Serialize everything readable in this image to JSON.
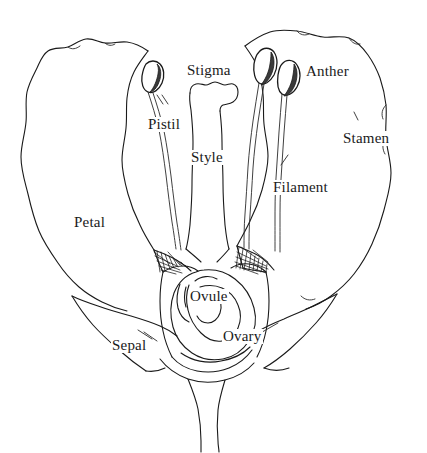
{
  "diagram": {
    "style": "hand-drawn line illustration",
    "ink_color": "#1a1a1a",
    "background_color": "#ffffff",
    "labels": [
      {
        "id": "stigma",
        "text": "Stigma",
        "x": 186,
        "y": 63,
        "part": "stigma"
      },
      {
        "id": "anther",
        "text": "Anther",
        "x": 305,
        "y": 64,
        "part": "anther"
      },
      {
        "id": "pistil",
        "text": "Pistil",
        "x": 147,
        "y": 117,
        "part": "pistil"
      },
      {
        "id": "stamen",
        "text": "Stamen",
        "x": 342,
        "y": 131,
        "part": "stamen"
      },
      {
        "id": "style",
        "text": "Style",
        "x": 190,
        "y": 150,
        "part": "style"
      },
      {
        "id": "filament",
        "text": "Filament",
        "x": 272,
        "y": 180,
        "part": "filament"
      },
      {
        "id": "petal",
        "text": "Petal",
        "x": 73,
        "y": 215,
        "part": "petal"
      },
      {
        "id": "ovule",
        "text": "Ovule",
        "x": 189,
        "y": 289,
        "part": "ovule"
      },
      {
        "id": "ovary",
        "text": "Ovary",
        "x": 222,
        "y": 329,
        "part": "ovary"
      },
      {
        "id": "sepal",
        "text": "Sepal",
        "x": 111,
        "y": 338,
        "part": "sepal"
      }
    ]
  }
}
